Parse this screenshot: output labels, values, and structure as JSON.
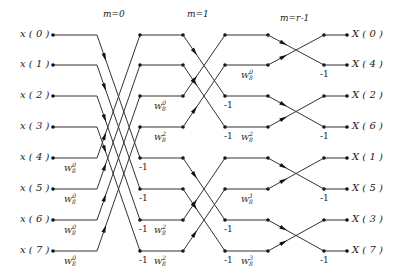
{
  "stages": [
    "m=0",
    "m=1",
    "m=r-1"
  ],
  "inputs": [
    "x(0)",
    "x(1)",
    "x(2)",
    "x(3)",
    "x(4)",
    "x(5)",
    "x(6)",
    "x(7)"
  ],
  "outputs": [
    "X(0)",
    "X(4)",
    "X(2)",
    "X(6)",
    "X(1)",
    "X(5)",
    "X(3)",
    "X(7)"
  ],
  "twiddle_symbol": "W",
  "twiddle_base": "8",
  "stage0_twiddles": [
    "0",
    "0",
    "0",
    "0"
  ],
  "stage1_twiddles": [
    "0",
    "2",
    "0",
    "2"
  ],
  "stage2_twiddles": [
    "0",
    "0",
    "0",
    "0"
  ],
  "minus_one": "-1"
}
